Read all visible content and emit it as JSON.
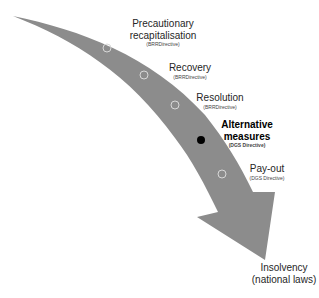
{
  "diagram": {
    "arrow_color": "#8c8c8c",
    "stages": [
      {
        "title_lines": [
          "Precautionary",
          "recapitalisation"
        ],
        "subtitle": "(BRRDirective)",
        "marker": "hollow",
        "highlighted": false
      },
      {
        "title_lines": [
          "Recovery"
        ],
        "subtitle": "(BRRDirective)",
        "marker": "hollow",
        "highlighted": false
      },
      {
        "title_lines": [
          "Resolution"
        ],
        "subtitle": "(BRRDirective)",
        "marker": "hollow",
        "highlighted": false
      },
      {
        "title_lines": [
          "Alternative",
          "measures"
        ],
        "subtitle": "(DGS Directive)",
        "marker": "filled",
        "highlighted": true
      },
      {
        "title_lines": [
          "Pay-out"
        ],
        "subtitle": "(DGS Directive)",
        "marker": "hollow",
        "highlighted": false
      }
    ],
    "end_point": {
      "lines": [
        "Insolvency",
        "(national laws)"
      ]
    }
  }
}
